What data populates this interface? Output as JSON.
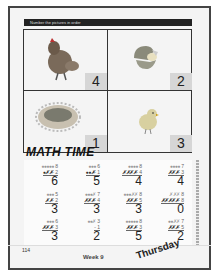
{
  "header": {
    "instruction": "Number the pictures in order"
  },
  "pictures": [
    {
      "subject": "hen",
      "number": "4",
      "icon": "hen-icon"
    },
    {
      "subject": "hatching-egg",
      "number": "2",
      "icon": "egg-icon"
    },
    {
      "subject": "nest",
      "number": "1",
      "icon": "nest-icon"
    },
    {
      "subject": "chick",
      "number": "3",
      "icon": "chick-icon"
    }
  ],
  "math": {
    "title": "MATH TIME",
    "problems": [
      {
        "top_marks": "●●●●●",
        "top": "8",
        "mid_marks": "●✗✗",
        "mid": "- 2",
        "answer": "6"
      },
      {
        "top_marks": "●●●",
        "top": "6",
        "mid_marks": "●●✗",
        "mid": "- 1",
        "answer": "5"
      },
      {
        "top_marks": "●●●●",
        "top": "8",
        "mid_marks": "✗✗✗✗",
        "mid": "- 4",
        "answer": "4"
      },
      {
        "top_marks": "●●●●",
        "top": "7",
        "mid_marks": "✗✗✗",
        "mid": "- 3",
        "answer": "4"
      },
      {
        "top_marks": "●●●",
        "top": "5",
        "mid_marks": "✗✗",
        "mid": "- 2",
        "answer": "3"
      },
      {
        "top_marks": "●●●✗",
        "top": "7",
        "mid_marks": "✗✗✗",
        "mid": "- 4",
        "answer": "3"
      },
      {
        "top_marks": "●●●✗✗",
        "top": "8",
        "mid_marks": "✗✗✗",
        "mid": "- 5",
        "answer": "3"
      },
      {
        "top_marks": "✗✗✗",
        "top": "8",
        "mid_marks": "✗✗✗✗✗",
        "mid": "- 8",
        "answer": "0"
      },
      {
        "top_marks": "●●●",
        "top": "6",
        "mid_marks": "✗✗✗",
        "mid": "- 3",
        "answer": "3"
      },
      {
        "top_marks": "●●✗",
        "top": "3",
        "mid_marks": "",
        "mid": "- 1",
        "answer": "2"
      },
      {
        "top_marks": "●●●●●",
        "top": "8",
        "mid_marks": "✗✗✗",
        "mid": "- 3",
        "answer": "5"
      },
      {
        "top_marks": "●●✗✗",
        "top": "7",
        "mid_marks": "✗✗✗",
        "mid": "- 5",
        "answer": "2"
      }
    ]
  },
  "footer": {
    "page_number": "114",
    "week": "Week 9",
    "day": "Thursday"
  }
}
